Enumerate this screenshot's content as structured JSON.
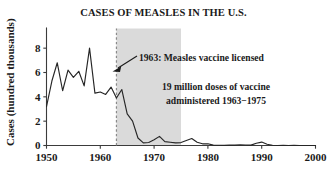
{
  "chart_data": {
    "type": "line",
    "title": "CASES OF MEASLES IN THE U.S.",
    "xlabel": "",
    "ylabel": "Cases (hundred thousands)",
    "xlim": [
      1950,
      2000
    ],
    "ylim": [
      0,
      9
    ],
    "grid": false,
    "legend": "none",
    "xticks": [
      1950,
      1960,
      1970,
      1980,
      1990,
      2000
    ],
    "xtick_labels": [
      "1950",
      "1960",
      "1970",
      "1980",
      "1990",
      "2000"
    ],
    "yticks": [
      0,
      2,
      4,
      6,
      8
    ],
    "ytick_labels": [
      "0",
      "2",
      "4",
      "6",
      "8"
    ],
    "x": [
      1950,
      1951,
      1952,
      1953,
      1954,
      1955,
      1956,
      1957,
      1958,
      1959,
      1960,
      1961,
      1962,
      1963,
      1964,
      1965,
      1966,
      1967,
      1968,
      1969,
      1970,
      1971,
      1972,
      1973,
      1974,
      1975,
      1976,
      1977,
      1978,
      1979,
      1980,
      1981,
      1982,
      1983,
      1984,
      1985,
      1986,
      1987,
      1988,
      1989,
      1990,
      1991,
      1992,
      1993,
      1994,
      1995,
      1996,
      1997,
      1998,
      1999,
      2000
    ],
    "values": [
      3.2,
      5.3,
      6.8,
      4.5,
      6.2,
      5.6,
      6.1,
      4.9,
      8.0,
      4.3,
      4.4,
      4.2,
      4.8,
      3.9,
      4.6,
      2.6,
      2.0,
      0.62,
      0.22,
      0.25,
      0.47,
      0.75,
      0.32,
      0.27,
      0.22,
      0.24,
      0.41,
      0.57,
      0.27,
      0.14,
      0.14,
      0.03,
      0.02,
      0.01,
      0.03,
      0.03,
      0.06,
      0.04,
      0.03,
      0.18,
      0.28,
      0.1,
      0.02,
      0.003,
      0.01,
      0.003,
      0.005,
      0.001,
      0.001,
      0.001,
      0.001
    ],
    "series": [
      {
        "name": "Measles cases (hundred thousands)",
        "values": [
          3.2,
          5.3,
          6.8,
          4.5,
          6.2,
          5.6,
          6.1,
          4.9,
          8.0,
          4.3,
          4.4,
          4.2,
          4.8,
          3.9,
          4.6,
          2.6,
          2.0,
          0.62,
          0.22,
          0.25,
          0.47,
          0.75,
          0.32,
          0.27,
          0.22,
          0.24,
          0.41,
          0.57,
          0.27,
          0.14,
          0.14,
          0.03,
          0.02,
          0.01,
          0.03,
          0.03,
          0.06,
          0.04,
          0.03,
          0.18,
          0.28,
          0.1,
          0.02,
          0.003,
          0.01,
          0.003,
          0.005,
          0.001,
          0.001,
          0.001,
          0.001
        ]
      }
    ],
    "annotations": [
      {
        "id": "vaccine-licensed",
        "text": "1963: Measles vaccine licensed",
        "x": 1963,
        "kind": "arrow-label"
      },
      {
        "id": "doses-line1",
        "text": "19 million doses of vaccine",
        "kind": "text"
      },
      {
        "id": "doses-line2",
        "text": "administered 1963−1975",
        "kind": "text"
      }
    ],
    "event_line": {
      "label": "1963 vaccine licensed",
      "x": 1963
    },
    "shaded_span": {
      "label": "1963−1975 vaccination campaign",
      "x0": 1963,
      "x1": 1975,
      "color": "#d5d5d5"
    },
    "colors": {
      "line": "#262626",
      "axis": "#3b3b3b",
      "band": "#d5d5d5",
      "event": "#8a8a8a",
      "text": "#1a1a1a",
      "background": "#ffffff"
    }
  }
}
